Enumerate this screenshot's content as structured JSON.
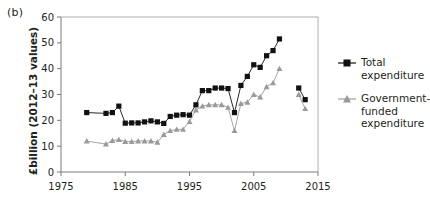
{
  "figure": {
    "panel_label": "(b)",
    "ylabel": "£billion (2012–13 values)"
  },
  "legend": {
    "items": [
      {
        "name": "total-expenditure",
        "label": "Total\nexpenditure",
        "marker": "square",
        "color": "#111111"
      },
      {
        "name": "government-funded-expenditure",
        "label": "Government-\nfunded\nexpenditure",
        "marker": "triangle",
        "color": "#9a9a9a"
      }
    ]
  },
  "chart_data": {
    "type": "line",
    "title": "",
    "xlabel": "",
    "ylabel": "£billion (2012–13 values)",
    "xlim": [
      1975,
      2015
    ],
    "ylim": [
      0,
      60
    ],
    "xticks": [
      1975,
      1985,
      1995,
      2005,
      2015
    ],
    "yticks": [
      0,
      10,
      20,
      30,
      40,
      50,
      60
    ],
    "grid": false,
    "legend_position": "right",
    "series": [
      {
        "name": "Total expenditure",
        "marker": "square",
        "color": "#111111",
        "points": [
          {
            "x": 1979,
            "y": 23.0,
            "connected": false
          },
          {
            "x": 1982,
            "y": 22.7,
            "connected": true
          },
          {
            "x": 1983,
            "y": 23.0
          },
          {
            "x": 1984,
            "y": 25.5
          },
          {
            "x": 1985,
            "y": 18.9
          },
          {
            "x": 1986,
            "y": 19.0
          },
          {
            "x": 1987,
            "y": 19.0
          },
          {
            "x": 1988,
            "y": 19.4
          },
          {
            "x": 1989,
            "y": 19.8
          },
          {
            "x": 1990,
            "y": 19.4
          },
          {
            "x": 1991,
            "y": 18.8
          },
          {
            "x": 1992,
            "y": 21.5
          },
          {
            "x": 1993,
            "y": 22.0
          },
          {
            "x": 1994,
            "y": 22.2
          },
          {
            "x": 1995,
            "y": 22.0
          },
          {
            "x": 1996,
            "y": 26.0
          },
          {
            "x": 1997,
            "y": 31.5
          },
          {
            "x": 1998,
            "y": 31.5
          },
          {
            "x": 1999,
            "y": 32.5
          },
          {
            "x": 2000,
            "y": 32.5
          },
          {
            "x": 2001,
            "y": 32.3
          },
          {
            "x": 2002,
            "y": 23.0
          },
          {
            "x": 2003,
            "y": 33.5
          },
          {
            "x": 2004,
            "y": 37.0
          },
          {
            "x": 2005,
            "y": 41.5
          },
          {
            "x": 2006,
            "y": 40.5
          },
          {
            "x": 2007,
            "y": 45.0
          },
          {
            "x": 2008,
            "y": 47.0
          },
          {
            "x": 2009,
            "y": 51.5
          },
          {
            "x": 2012,
            "y": 32.5,
            "connected": false
          },
          {
            "x": 2013,
            "y": 28.0
          }
        ]
      },
      {
        "name": "Government-funded expenditure",
        "marker": "triangle",
        "color": "#9a9a9a",
        "points": [
          {
            "x": 1979,
            "y": 12.0,
            "connected": false
          },
          {
            "x": 1982,
            "y": 10.8,
            "connected": true
          },
          {
            "x": 1983,
            "y": 12.2
          },
          {
            "x": 1984,
            "y": 12.5
          },
          {
            "x": 1985,
            "y": 11.8
          },
          {
            "x": 1986,
            "y": 11.8
          },
          {
            "x": 1987,
            "y": 12.0
          },
          {
            "x": 1988,
            "y": 12.0
          },
          {
            "x": 1989,
            "y": 12.0
          },
          {
            "x": 1990,
            "y": 11.5
          },
          {
            "x": 1991,
            "y": 14.5
          },
          {
            "x": 1992,
            "y": 16.0
          },
          {
            "x": 1993,
            "y": 16.5
          },
          {
            "x": 1994,
            "y": 16.5
          },
          {
            "x": 1995,
            "y": 19.5
          },
          {
            "x": 1996,
            "y": 24.0
          },
          {
            "x": 1997,
            "y": 25.5
          },
          {
            "x": 1998,
            "y": 26.0
          },
          {
            "x": 1999,
            "y": 26.0
          },
          {
            "x": 2000,
            "y": 26.0
          },
          {
            "x": 2001,
            "y": 25.0
          },
          {
            "x": 2002,
            "y": 16.0
          },
          {
            "x": 2003,
            "y": 26.5
          },
          {
            "x": 2004,
            "y": 27.0
          },
          {
            "x": 2005,
            "y": 30.0
          },
          {
            "x": 2006,
            "y": 29.0
          },
          {
            "x": 2007,
            "y": 33.0
          },
          {
            "x": 2008,
            "y": 34.5
          },
          {
            "x": 2009,
            "y": 40.0
          },
          {
            "x": 2012,
            "y": 30.0,
            "connected": false
          },
          {
            "x": 2013,
            "y": 24.5
          }
        ]
      }
    ]
  }
}
